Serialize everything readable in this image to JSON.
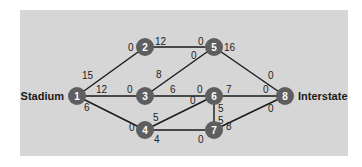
{
  "diagram": {
    "source_label": "Stadium",
    "sink_label": "Interstate",
    "colors": {
      "panel": "#d6d6d6",
      "node": "#5e5e5e",
      "node_text": "#ffffff",
      "edge": "#1a1a1a"
    },
    "nodes": [
      {
        "id": "1",
        "x": 77,
        "y": 96
      },
      {
        "id": "2",
        "x": 145,
        "y": 47
      },
      {
        "id": "3",
        "x": 145,
        "y": 96
      },
      {
        "id": "4",
        "x": 145,
        "y": 130
      },
      {
        "id": "5",
        "x": 214,
        "y": 47
      },
      {
        "id": "6",
        "x": 214,
        "y": 96
      },
      {
        "id": "7",
        "x": 214,
        "y": 130
      },
      {
        "id": "8",
        "x": 285,
        "y": 96
      }
    ],
    "edges": [
      {
        "from": "1",
        "to": "2",
        "cap_from": "15",
        "cap_to": "0"
      },
      {
        "from": "1",
        "to": "3",
        "cap_from": "12",
        "cap_to": "0"
      },
      {
        "from": "1",
        "to": "4",
        "cap_from": "6",
        "cap_to": "0"
      },
      {
        "from": "2",
        "to": "5",
        "cap_from": "12",
        "cap_to": "0"
      },
      {
        "from": "3",
        "to": "5",
        "cap_from": "8",
        "cap_to": "0"
      },
      {
        "from": "3",
        "to": "6",
        "cap_from": "6",
        "cap_to": "0"
      },
      {
        "from": "4",
        "to": "6",
        "cap_from": "5",
        "cap_to": "0"
      },
      {
        "from": "4",
        "to": "7",
        "cap_from": "4",
        "cap_to": "0"
      },
      {
        "from": "5",
        "to": "8",
        "cap_from": "16",
        "cap_to": "0"
      },
      {
        "from": "6",
        "to": "8",
        "cap_from": "7",
        "cap_to": "0"
      },
      {
        "from": "6",
        "to": "7",
        "cap_from": "5",
        "cap_to": "5"
      },
      {
        "from": "7",
        "to": "8",
        "cap_from": "8",
        "cap_to": "0"
      }
    ]
  }
}
